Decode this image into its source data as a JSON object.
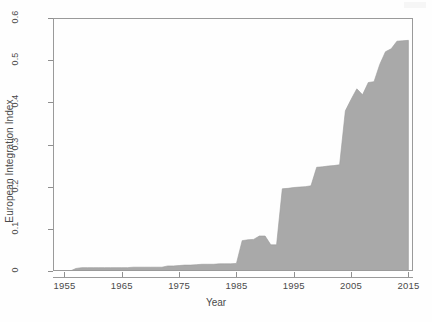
{
  "chart_data": {
    "type": "area",
    "title": "",
    "xlabel": "Year",
    "ylabel": "European Integration Index",
    "xlim": [
      1953,
      2015.8
    ],
    "ylim": [
      0,
      0.6
    ],
    "xticks": [
      1955,
      1965,
      1975,
      1985,
      1995,
      2005,
      2015
    ],
    "xtick_labels": [
      "1955",
      "1965",
      "1975",
      "1985",
      "1995",
      "2005",
      "2015"
    ],
    "yticks": [
      0,
      0.1,
      0.2,
      0.3,
      0.4,
      0.5,
      0.6
    ],
    "ytick_labels": [
      "0",
      "0.1",
      "0.2",
      "0.3",
      "0.4",
      "0.5",
      "0.6"
    ],
    "grid": false,
    "legend": "none",
    "fill_color": "#a9a9a9",
    "line_color": "#9a9a9a",
    "series": [
      {
        "name": "European Integration Index",
        "x": [
          1953,
          1954,
          1955,
          1956,
          1957,
          1958,
          1959,
          1960,
          1961,
          1962,
          1963,
          1964,
          1965,
          1966,
          1967,
          1968,
          1969,
          1970,
          1971,
          1972,
          1973,
          1974,
          1975,
          1976,
          1977,
          1978,
          1979,
          1980,
          1981,
          1982,
          1983,
          1984,
          1985,
          1986,
          1987,
          1988,
          1989,
          1990,
          1991,
          1992,
          1993,
          1994,
          1995,
          1996,
          1997,
          1998,
          1999,
          2000,
          2001,
          2002,
          2003,
          2004,
          2005,
          2006,
          2007,
          2008,
          2009,
          2010,
          2011,
          2012,
          2013,
          2014,
          2015
        ],
        "values": [
          0.0,
          0.0,
          0.0,
          0.0,
          0.006,
          0.008,
          0.008,
          0.008,
          0.008,
          0.008,
          0.008,
          0.008,
          0.008,
          0.008,
          0.009,
          0.009,
          0.009,
          0.009,
          0.009,
          0.009,
          0.012,
          0.012,
          0.013,
          0.014,
          0.014,
          0.015,
          0.016,
          0.016,
          0.016,
          0.017,
          0.017,
          0.017,
          0.018,
          0.072,
          0.074,
          0.075,
          0.083,
          0.083,
          0.062,
          0.062,
          0.195,
          0.196,
          0.198,
          0.199,
          0.2,
          0.202,
          0.246,
          0.247,
          0.249,
          0.25,
          0.252,
          0.38,
          0.407,
          0.432,
          0.418,
          0.447,
          0.449,
          0.49,
          0.52,
          0.527,
          0.545,
          0.546,
          0.547
        ]
      }
    ]
  },
  "axes": {
    "y_label": "European Integration Index",
    "x_label": "Year"
  }
}
